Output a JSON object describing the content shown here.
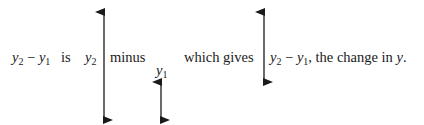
{
  "diagram": {
    "colors": {
      "text": "#1a1a1a",
      "arrow": "#1a1a1a",
      "background": "#ffffff"
    },
    "segments": [
      {
        "id": "expr",
        "var": "y",
        "sub": "2",
        "op": " − ",
        "var2": "y",
        "sub2": "1"
      },
      {
        "id": "is",
        "text": "is"
      },
      {
        "id": "y2",
        "var": "y",
        "sub": "2"
      },
      {
        "id": "minus",
        "text": "minus"
      },
      {
        "id": "y1",
        "var": "y",
        "sub": "1"
      },
      {
        "id": "which_gives",
        "text": "which gives"
      },
      {
        "id": "result_expr",
        "var": "y",
        "sub": "2",
        "op": " − ",
        "var2": "y",
        "sub2": "1"
      },
      {
        "id": "result_text",
        "text": ", the change in "
      },
      {
        "id": "result_var",
        "var": "y"
      },
      {
        "id": "period",
        "text": "."
      }
    ],
    "arrows": [
      {
        "name": "y2-height-arrow",
        "x": 104,
        "y_top": 12,
        "y_bottom": 120,
        "label": "y2"
      },
      {
        "name": "y1-height-arrow",
        "x": 161,
        "y_top": 82,
        "y_bottom": 120,
        "label": "y1"
      },
      {
        "name": "change-in-y-arrow",
        "x": 264,
        "y_top": 12,
        "y_bottom": 82,
        "label": "y2 - y1"
      }
    ]
  }
}
